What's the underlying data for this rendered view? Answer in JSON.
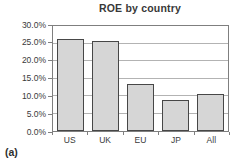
{
  "panel_label": "(a)",
  "chart_data": {
    "type": "bar",
    "title": "ROE by country",
    "categories": [
      "US",
      "UK",
      "EU",
      "JP",
      "All"
    ],
    "values": [
      26.3,
      25.7,
      13.3,
      9.0,
      10.5
    ],
    "value_unit": "%",
    "xlabel": "",
    "ylabel": "",
    "ylim": [
      0,
      30
    ],
    "ytick_step": 5,
    "ytick_labels": [
      "0.0%",
      "5.0%",
      "10.0%",
      "15.0%",
      "20.0%",
      "25.0%",
      "30.0%"
    ],
    "grid": "horizontal",
    "legend_position": "none",
    "colors": {
      "bar_fill": "#d6d6d6",
      "bar_border": "#474747",
      "gridline": "#b3b3b3",
      "plot_border": "#7f7f7f",
      "text": "#3a3a3a",
      "background": "#ffffff"
    }
  }
}
